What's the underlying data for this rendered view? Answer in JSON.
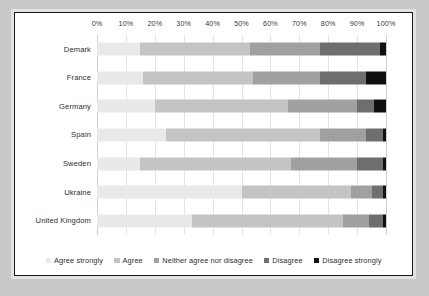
{
  "chart_data": {
    "type": "bar",
    "orientation": "horizontal",
    "stacked": true,
    "normalized_percent": true,
    "title": "",
    "subtitle": "",
    "xlabel": "",
    "ylabel": "",
    "xlim": [
      0,
      100
    ],
    "grid": true,
    "legend_position": "bottom",
    "xticks": [
      "0%",
      "10%",
      "20%",
      "30%",
      "40%",
      "50%",
      "60%",
      "70%",
      "80%",
      "90%",
      "100%"
    ],
    "xtick_values": [
      0,
      10,
      20,
      30,
      40,
      50,
      60,
      70,
      80,
      90,
      100
    ],
    "categories": [
      "Demark",
      "France",
      "Germany",
      "Spain",
      "Sweden",
      "Ukraine",
      "United Kingdom"
    ],
    "series": [
      {
        "name": "Agree strongly",
        "color": "#e9e9e9",
        "values": [
          15,
          16,
          20,
          24,
          15,
          50,
          33
        ]
      },
      {
        "name": "Agree",
        "color": "#c4c4c4",
        "values": [
          38,
          38,
          46,
          53,
          52,
          38,
          52
        ]
      },
      {
        "name": "Neither agree nor disagree",
        "color": "#a0a0a0",
        "values": [
          24,
          23,
          24,
          16,
          23,
          7,
          9
        ]
      },
      {
        "name": "Disagree",
        "color": "#6e6e6e",
        "values": [
          21,
          16,
          6,
          6,
          9,
          4,
          5
        ]
      },
      {
        "name": "Disagree strongly",
        "color": "#101010",
        "values": [
          2,
          7,
          4,
          1,
          1,
          1,
          1
        ]
      }
    ]
  },
  "legend": {
    "items": [
      {
        "label": "Agree strongly",
        "color": "#e9e9e9"
      },
      {
        "label": "Agree",
        "color": "#c4c4c4"
      },
      {
        "label": "Neither agree nor disagree",
        "color": "#a0a0a0"
      },
      {
        "label": "Disagree",
        "color": "#6e6e6e"
      },
      {
        "label": "Disagree strongly",
        "color": "#101010"
      }
    ]
  },
  "colors": {
    "page_background": "#c9c9c9",
    "panel_background": "#ffffff",
    "panel_border": "#1a1a1a",
    "gridline": "#e4e4e4",
    "text": "#2d2d2d"
  }
}
